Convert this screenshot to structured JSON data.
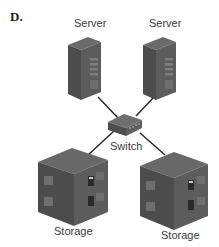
{
  "figure": {
    "label": "D.",
    "nodes": {
      "server_left": "Server",
      "server_right": "Server",
      "switch": "Switch",
      "storage_left": "Storage",
      "storage_right": "Storage"
    },
    "connections": [
      [
        "server_left",
        "switch"
      ],
      [
        "server_right",
        "switch"
      ],
      [
        "switch",
        "storage_left"
      ],
      [
        "switch",
        "storage_right"
      ]
    ],
    "colors": {
      "device_dark": "#4a4a4a",
      "device_mid": "#5e5e5e",
      "device_light": "#7a7a7a",
      "line": "#222222"
    }
  }
}
